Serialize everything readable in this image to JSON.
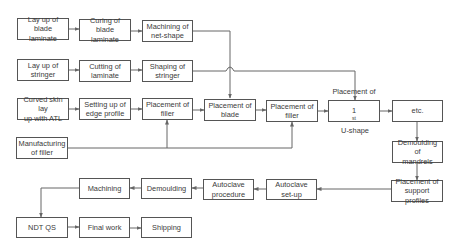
{
  "diagram": {
    "type": "process-flowchart",
    "line_color": "#666666",
    "nodes": [
      {
        "id": "layup_blade",
        "label": "Lay up of blade\nlaminate"
      },
      {
        "id": "curing_blade",
        "label": "Curing of blade\nlaminate"
      },
      {
        "id": "machining_net",
        "label": "Machining of\nnet-shape"
      },
      {
        "id": "layup_stringer",
        "label": "Lay up of\nstringer"
      },
      {
        "id": "cutting_laminate",
        "label": "Cutting of\nlaminate"
      },
      {
        "id": "shaping_stringer",
        "label": "Shaping of\nstringer"
      },
      {
        "id": "curved_skin",
        "label": "Curved skin lay\nup with ATL"
      },
      {
        "id": "edge_profile",
        "label": "Setting up of\nedge profile"
      },
      {
        "id": "placement_filler_1",
        "label": "Placement of\nfiller"
      },
      {
        "id": "placement_blade",
        "label": "Placement of\nblade"
      },
      {
        "id": "placement_filler_2",
        "label": "Placement of\nfiller"
      },
      {
        "id": "placement_ushape",
        "label_line1": "Placement of",
        "label_num": "1",
        "label_sup": "st",
        "label_rest": " U-shape"
      },
      {
        "id": "etc",
        "label": "etc."
      },
      {
        "id": "manufacturing_filler",
        "label": "Manufacturing\nof filler"
      },
      {
        "id": "demoulding_mandrels",
        "label": "Demoulding of\nmandrels"
      },
      {
        "id": "support_profiles",
        "label": "Placement of\nsupport profiles"
      },
      {
        "id": "autoclave_setup",
        "label": "Autoclave\nset-up"
      },
      {
        "id": "autoclave_procedure",
        "label": "Autoclave\nprocedure"
      },
      {
        "id": "demoulding",
        "label": "Demoulding"
      },
      {
        "id": "machining",
        "label": "Machining"
      },
      {
        "id": "ndt_qs",
        "label": "NDT QS"
      },
      {
        "id": "final_work",
        "label": "Final work"
      },
      {
        "id": "shipping",
        "label": "Shipping"
      }
    ],
    "edges": [
      [
        "layup_blade",
        "curing_blade"
      ],
      [
        "curing_blade",
        "machining_net"
      ],
      [
        "machining_net",
        "placement_blade"
      ],
      [
        "layup_stringer",
        "cutting_laminate"
      ],
      [
        "cutting_laminate",
        "shaping_stringer"
      ],
      [
        "shaping_stringer",
        "placement_ushape"
      ],
      [
        "curved_skin",
        "edge_profile"
      ],
      [
        "edge_profile",
        "placement_filler_1"
      ],
      [
        "placement_filler_1",
        "placement_blade"
      ],
      [
        "placement_blade",
        "placement_filler_2"
      ],
      [
        "placement_filler_2",
        "placement_ushape"
      ],
      [
        "placement_ushape",
        "etc"
      ],
      [
        "manufacturing_filler",
        "placement_filler_1"
      ],
      [
        "manufacturing_filler",
        "placement_filler_2"
      ],
      [
        "etc",
        "demoulding_mandrels"
      ],
      [
        "demoulding_mandrels",
        "support_profiles"
      ],
      [
        "support_profiles",
        "autoclave_setup"
      ],
      [
        "autoclave_setup",
        "autoclave_procedure"
      ],
      [
        "autoclave_procedure",
        "demoulding"
      ],
      [
        "demoulding",
        "machining"
      ],
      [
        "machining",
        "ndt_qs"
      ],
      [
        "ndt_qs",
        "final_work"
      ],
      [
        "final_work",
        "shipping"
      ]
    ]
  }
}
